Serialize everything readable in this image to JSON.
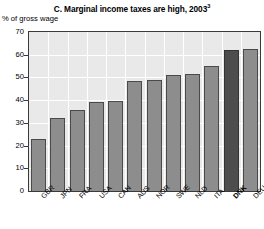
{
  "chart_data": {
    "type": "bar",
    "title": "C. Marginal income taxes are high, 2003",
    "title_superscript": "3",
    "subtitle": "",
    "xlabel": "",
    "ylabel": "% of gross wage",
    "ylim": [
      0,
      70
    ],
    "ytick_labels": [
      "0",
      "10",
      "20",
      "30",
      "40",
      "50",
      "60",
      "70"
    ],
    "ytick_values": [
      0,
      10,
      20,
      30,
      40,
      50,
      60,
      70
    ],
    "grid": true,
    "legend": "none",
    "categories": [
      "GBR",
      "JPN",
      "FRA",
      "USA",
      "CAN",
      "AUS",
      "NOR",
      "SWE",
      "NLD",
      "ITA",
      "DNK",
      "DEU"
    ],
    "values": [
      23,
      32,
      35.5,
      39,
      39.5,
      48.5,
      49,
      51,
      51.5,
      55,
      62,
      62.5
    ],
    "highlight_category": "DNK",
    "colors": {
      "bar": "#8d8d8d",
      "bar_border": "#4a4a4a",
      "bar_highlight": "#4d4d4d",
      "plot_background": "#e9e9e9",
      "gridline": "#ffffff",
      "axis": "#3a3a3a",
      "text": "#000000"
    }
  }
}
